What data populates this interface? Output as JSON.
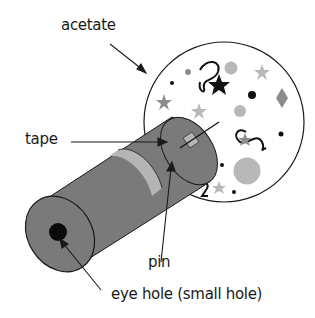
{
  "diagram": {
    "type": "labeled illustration",
    "labels": {
      "acetate": "acetate",
      "tape": "tape",
      "pin": "pin",
      "eye_hole": "eye hole (small hole)"
    },
    "colors": {
      "tube": "#7a7a7a",
      "tube_band": "#b5b5b5",
      "outline": "#1a1a1a",
      "disc": "#ffffff",
      "light_shape": "#b8b8b8",
      "mid_shape": "#8c8c8c",
      "dark_shape": "#111111"
    }
  }
}
